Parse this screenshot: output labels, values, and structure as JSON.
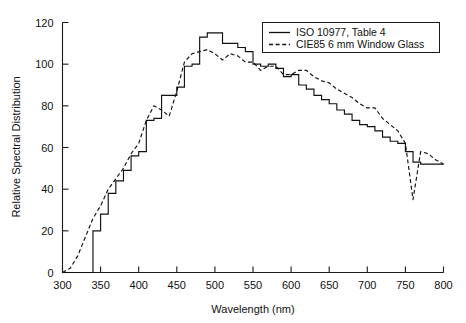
{
  "chart_data": {
    "type": "line",
    "title": "",
    "xlabel": "Wavelength (nm)",
    "ylabel": "Relative Spectral Distribution",
    "xlim": [
      300,
      800
    ],
    "ylim": [
      0,
      120
    ],
    "xticks": [
      300,
      350,
      400,
      450,
      500,
      550,
      600,
      650,
      700,
      750,
      800
    ],
    "yticks": [
      0,
      20,
      40,
      60,
      80,
      100,
      120
    ],
    "grid": false,
    "legend_position": "top-right",
    "x": [
      300,
      310,
      320,
      330,
      340,
      350,
      360,
      370,
      380,
      390,
      400,
      410,
      420,
      430,
      440,
      450,
      460,
      470,
      480,
      490,
      500,
      510,
      520,
      530,
      540,
      550,
      560,
      570,
      580,
      590,
      600,
      610,
      620,
      630,
      640,
      650,
      660,
      670,
      680,
      690,
      700,
      710,
      720,
      730,
      740,
      750,
      760,
      770,
      780,
      790,
      800
    ],
    "series": [
      {
        "name": "ISO 10977, Table 4",
        "style": "solid",
        "step": "post",
        "values": [
          0,
          0,
          0,
          0,
          20,
          28,
          38,
          44,
          49,
          56,
          58,
          73,
          74,
          85,
          85,
          89,
          99,
          100,
          113,
          115,
          115,
          110,
          110,
          108,
          106,
          100,
          99,
          100,
          98,
          94,
          95,
          90,
          88,
          85,
          83,
          81,
          78,
          76,
          73,
          71,
          70,
          68,
          65,
          63,
          62,
          58,
          53,
          52,
          52,
          52,
          52
        ]
      },
      {
        "name": "CIE85 6 mm Window Glass",
        "style": "dashed",
        "step": "none",
        "values": [
          0,
          2,
          8,
          17,
          26,
          32,
          40,
          45,
          50,
          57,
          62,
          73,
          80,
          78,
          75,
          87,
          101,
          105,
          106,
          107,
          105,
          102,
          105,
          104,
          101,
          101,
          97,
          99,
          99,
          95,
          95,
          97,
          97,
          94,
          92,
          91,
          88,
          86,
          84,
          81,
          79,
          79,
          74,
          71,
          68,
          62,
          35,
          58,
          57,
          54,
          52
        ]
      }
    ]
  },
  "legend": {
    "entries": [
      {
        "label": "ISO 10977, Table 4",
        "style": "solid"
      },
      {
        "label": "CIE85 6 mm Window Glass",
        "style": "dashed"
      }
    ]
  }
}
